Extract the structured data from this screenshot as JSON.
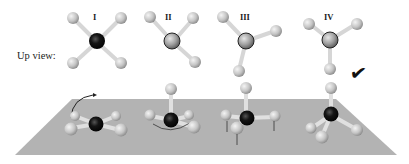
{
  "figure": {
    "row_label": "Up view:",
    "molecules": [
      {
        "id": "I",
        "label": "I",
        "center_atom": "dark",
        "correct": false
      },
      {
        "id": "II",
        "label": "II",
        "center_atom": "gray",
        "correct": false
      },
      {
        "id": "III",
        "label": "III",
        "center_atom": "gray",
        "correct": false
      },
      {
        "id": "IV",
        "label": "IV",
        "center_atom": "gray",
        "correct": true
      }
    ],
    "correct_mark": "✔",
    "colors": {
      "plane": "#b4b4b4",
      "central_atom_dark": "#111111",
      "central_atom_gray": "#9a9a9a",
      "ligand_atom": "#c8c8c8",
      "bond": "#d8d8d8"
    }
  }
}
